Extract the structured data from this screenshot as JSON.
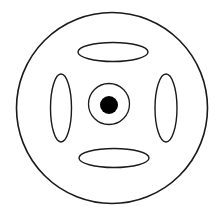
{
  "diagram": {
    "name": "wheel-rim-front-view",
    "background_color": "#ffffff",
    "stroke_color": "#1a1a1a",
    "fill_color": "#000000",
    "canvas": {
      "width": 223,
      "height": 214
    },
    "shapes": {
      "outer_rim": {
        "label": "outer-rim-circle",
        "type": "circle",
        "cx": 112,
        "cy": 108,
        "r": 95.5,
        "stroke_width": 1.6,
        "fill": "none"
      },
      "hub_ring": {
        "label": "hub-ring-circle",
        "type": "circle",
        "cx": 109,
        "cy": 104,
        "r": 20.5,
        "stroke_width": 1.3,
        "fill": "none"
      },
      "hub_center": {
        "label": "hub-center-dot",
        "type": "circle",
        "cx": 109,
        "cy": 105,
        "r": 9,
        "stroke_width": 0,
        "fill": "#000000"
      },
      "spoke_top": {
        "label": "spoke-opening-top",
        "type": "ellipse",
        "cx": 113,
        "cy": 52,
        "rx": 35,
        "ry": 9.5,
        "stroke_width": 1.4,
        "fill": "none"
      },
      "spoke_bottom": {
        "label": "spoke-opening-bottom",
        "type": "ellipse",
        "cx": 114,
        "cy": 158,
        "rx": 35,
        "ry": 9.5,
        "stroke_width": 1.4,
        "fill": "none"
      },
      "spoke_left": {
        "label": "spoke-opening-left",
        "type": "ellipse",
        "cx": 61,
        "cy": 108,
        "rx": 10.5,
        "ry": 34,
        "stroke_width": 1.4,
        "fill": "none"
      },
      "spoke_right": {
        "label": "spoke-opening-right",
        "type": "ellipse",
        "cx": 166,
        "cy": 108,
        "rx": 11,
        "ry": 34,
        "stroke_width": 1.4,
        "fill": "none"
      }
    }
  }
}
